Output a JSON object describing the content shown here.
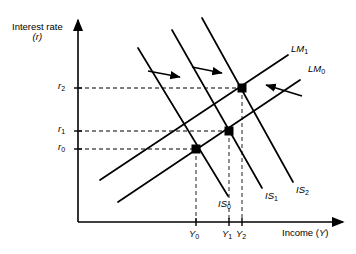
{
  "figure": {
    "type": "is-lm-diagram",
    "background": "#ffffff",
    "line_color": "#000000",
    "dash_color": "#555555"
  },
  "axes": {
    "y_title_line1": "Interest rate",
    "y_title_line2": "(r)",
    "x_title": "Income (",
    "x_title_var": "Y",
    "x_title_end": ")",
    "origin": {
      "x": 78,
      "y": 222
    },
    "x_end": {
      "x": 345,
      "y": 222
    },
    "y_end": {
      "x": 78,
      "y": 18
    }
  },
  "y_ticks": [
    {
      "name": "r2",
      "base": "r",
      "sub": "2",
      "y": 88
    },
    {
      "name": "r1",
      "base": "r",
      "sub": "1",
      "y": 131
    },
    {
      "name": "r0",
      "base": "r",
      "sub": "0",
      "y": 149
    }
  ],
  "x_ticks": [
    {
      "name": "Y0",
      "base": "Y",
      "sub": "0",
      "x": 196
    },
    {
      "name": "Y1",
      "base": "Y",
      "sub": "1",
      "x": 229
    },
    {
      "name": "Y2",
      "base": "Y",
      "sub": "2",
      "x": 242
    }
  ],
  "curves": {
    "lm": [
      {
        "name": "LM0",
        "base": "LM",
        "sub": "0",
        "x1": 118,
        "y1": 202,
        "x2": 300,
        "y2": 80,
        "label_x": 306,
        "label_y": 68
      },
      {
        "name": "LM1",
        "base": "LM",
        "sub": "1",
        "x1": 100,
        "y1": 180,
        "x2": 288,
        "y2": 55,
        "label_x": 292,
        "label_y": 48
      }
    ],
    "is": [
      {
        "name": "IS0",
        "base": "IS",
        "sub": "0",
        "x1": 138,
        "y1": 48,
        "x2": 228,
        "y2": 196,
        "label_x": 222,
        "label_y": 200
      },
      {
        "name": "IS1",
        "base": "IS",
        "sub": "1",
        "x1": 172,
        "y1": 30,
        "x2": 262,
        "y2": 188,
        "label_x": 268,
        "label_y": 192
      },
      {
        "name": "IS2",
        "base": "IS",
        "sub": "2",
        "x1": 202,
        "y1": 18,
        "x2": 293,
        "y2": 182,
        "label_x": 298,
        "label_y": 186
      }
    ]
  },
  "equilibria": [
    {
      "name": "E0",
      "x": 196,
      "y": 149
    },
    {
      "name": "E1",
      "x": 229,
      "y": 131
    },
    {
      "name": "E2",
      "x": 242,
      "y": 88
    }
  ],
  "guides": [
    {
      "name": "r2-guide",
      "x1": 78,
      "y1": 88,
      "x2": 242,
      "y2": 88,
      "orient": "h"
    },
    {
      "name": "r1-guide",
      "x1": 78,
      "y1": 131,
      "x2": 229,
      "y2": 131,
      "orient": "h"
    },
    {
      "name": "r0-guide",
      "x1": 78,
      "y1": 149,
      "x2": 196,
      "y2": 149,
      "orient": "h"
    },
    {
      "name": "Y0-guide",
      "x1": 196,
      "y1": 149,
      "x2": 196,
      "y2": 222,
      "orient": "v"
    },
    {
      "name": "Y1-guide",
      "x1": 229,
      "y1": 131,
      "x2": 229,
      "y2": 222,
      "orient": "v"
    },
    {
      "name": "Y2-guide",
      "x1": 242,
      "y1": 88,
      "x2": 242,
      "y2": 222,
      "orient": "v"
    }
  ],
  "shift_arrows": [
    {
      "name": "is-shift-arrow-1",
      "x1": 148,
      "y1": 72,
      "x2": 182,
      "y2": 77,
      "direction": "right"
    },
    {
      "name": "is-shift-arrow-2",
      "x1": 192,
      "y1": 68,
      "x2": 224,
      "y2": 73,
      "direction": "right"
    },
    {
      "name": "lm-shift-arrow",
      "x1": 300,
      "y1": 95,
      "x2": 262,
      "y2": 84,
      "direction": "left"
    }
  ]
}
